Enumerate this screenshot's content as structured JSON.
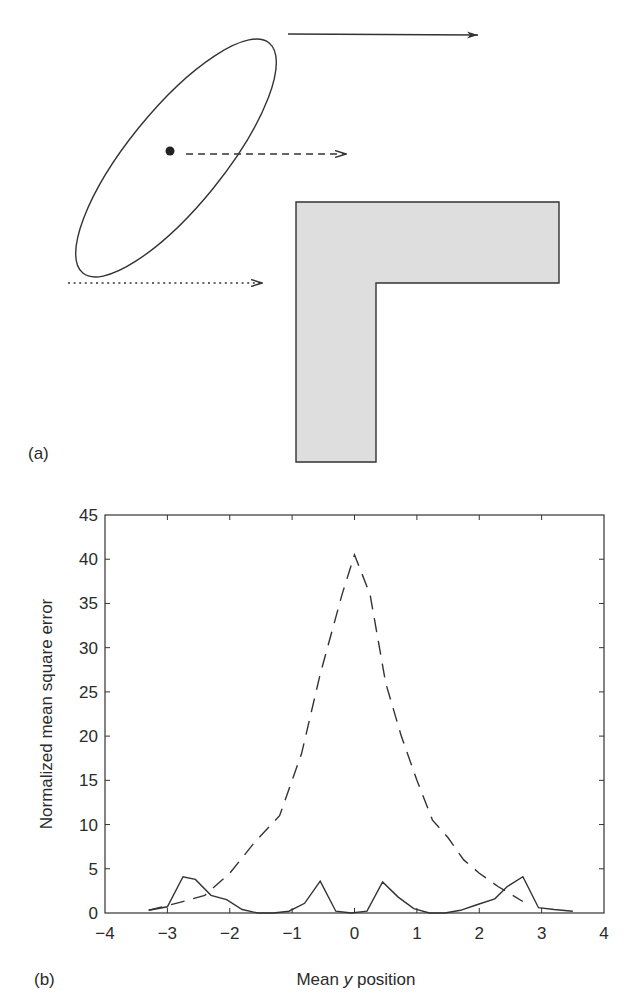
{
  "panel_a": {
    "label": "(a)",
    "ellipse": {
      "cx": 176,
      "cy": 158,
      "rx": 148,
      "ry": 48,
      "rotation_deg": -51,
      "stroke": "#333333"
    },
    "centroid_dot": {
      "cx": 170,
      "cy": 151,
      "r": 4.5
    },
    "arrows": [
      {
        "name": "solid-arrow",
        "style": "solid",
        "x1": 288,
        "y1": 34,
        "x2": 478,
        "y2": 35
      },
      {
        "name": "dashed-arrow",
        "style": "dashed",
        "x1": 186,
        "y1": 154,
        "x2": 346,
        "y2": 154
      },
      {
        "name": "dotted-arrow",
        "style": "dotted",
        "x1": 68,
        "y1": 283,
        "x2": 262,
        "y2": 283
      }
    ],
    "l_shape": {
      "points": "296,202 559,202 559,283 376,283 376,462 296,462",
      "fill": "#dedede",
      "stroke": "#333333"
    }
  },
  "panel_b": {
    "label": "(b)"
  },
  "chart_data": {
    "type": "line",
    "title": "",
    "xlabel_prefix": "Mean ",
    "xlabel_italic": "y",
    "xlabel_suffix": " position",
    "xlabel": "Mean y position",
    "ylabel": "Normalized mean square error",
    "xlim": [
      -4,
      4
    ],
    "ylim": [
      0,
      45
    ],
    "xticks": [
      -4,
      -3,
      -2,
      -1,
      0,
      1,
      2,
      3,
      4
    ],
    "xtick_labels": [
      "−4",
      "−3",
      "−2",
      "−1",
      "0",
      "1",
      "2",
      "3",
      "4"
    ],
    "yticks": [
      0,
      5,
      10,
      15,
      20,
      25,
      30,
      35,
      40,
      45
    ],
    "ytick_labels": [
      "0",
      "5",
      "10",
      "15",
      "20",
      "25",
      "30",
      "35",
      "40",
      "45"
    ],
    "grid": false,
    "legend": null,
    "series": [
      {
        "name": "solid",
        "style": "solid",
        "x": [
          -3.3,
          -3.0,
          -2.75,
          -2.55,
          -2.3,
          -2.05,
          -1.8,
          -1.55,
          -1.3,
          -1.05,
          -0.8,
          -0.55,
          -0.3,
          -0.05,
          0.2,
          0.45,
          0.7,
          0.95,
          1.2,
          1.45,
          1.7,
          1.95,
          2.25,
          2.45,
          2.7,
          2.95,
          3.2,
          3.5
        ],
        "values": [
          0.3,
          0.7,
          4.1,
          3.8,
          2.0,
          1.5,
          0.4,
          0.0,
          0.0,
          0.2,
          1.1,
          3.6,
          0.2,
          0.0,
          0.2,
          3.5,
          1.8,
          0.5,
          0.0,
          0.0,
          0.3,
          0.9,
          1.6,
          3.0,
          4.1,
          0.6,
          0.4,
          0.2
        ]
      },
      {
        "name": "dashed",
        "style": "dashed",
        "x": [
          -3.3,
          -2.8,
          -2.4,
          -2.0,
          -1.6,
          -1.2,
          -0.85,
          -0.55,
          -0.2,
          0.0,
          0.25,
          0.5,
          0.75,
          1.0,
          1.25,
          1.5,
          1.75,
          2.0,
          2.3,
          2.7
        ],
        "values": [
          0.3,
          1.2,
          2.0,
          4.5,
          8.0,
          11.0,
          18.0,
          27.0,
          36.0,
          40.5,
          36.0,
          26.0,
          20.0,
          15.0,
          10.5,
          8.5,
          6.0,
          4.5,
          3.0,
          1.3
        ]
      }
    ]
  }
}
